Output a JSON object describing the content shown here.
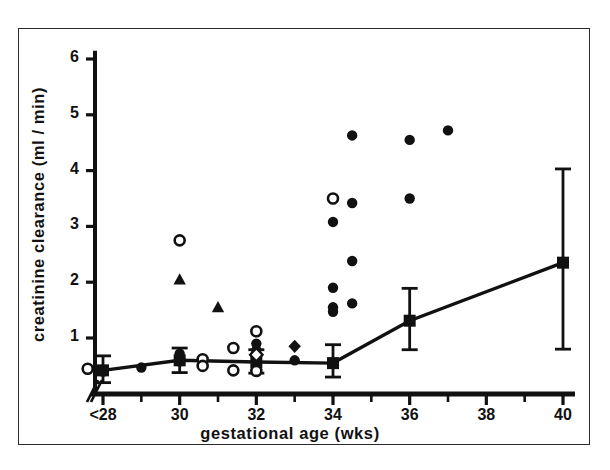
{
  "figure": {
    "name": "creatinine-clearance-vs-gestational-age",
    "background": "#ffffff",
    "ink_color": "#111111"
  },
  "chart_data": {
    "type": "scatter",
    "title": "",
    "xlabel": "gestational age (wks)",
    "ylabel": "creatinine clearance (ml / min)",
    "xlim": [
      27.0,
      41.0
    ],
    "ylim": [
      0,
      6.4
    ],
    "grid": false,
    "legend": "none",
    "x_ticks_major": [
      28,
      30,
      32,
      34,
      36,
      38,
      40
    ],
    "x_tick_labels": [
      "<28",
      "30",
      "32",
      "34",
      "36",
      "38",
      "40"
    ],
    "x_ticks_minor": [
      29,
      31,
      33,
      35,
      37,
      39
    ],
    "y_ticks": [
      1,
      2,
      3,
      4,
      5,
      6
    ],
    "y_tick_labels": [
      "1",
      "2",
      "3",
      "4",
      "5",
      "6"
    ],
    "axis_break": true,
    "axis_break_note": "double slash break on x-axis just left of <28",
    "series": [
      {
        "name": "mean with error bars",
        "marker": "filled-square",
        "line": true,
        "points": [
          {
            "x": 28.0,
            "y": 0.42,
            "err_low": 0.22,
            "err_high": 0.26
          },
          {
            "x": 30.0,
            "y": 0.6,
            "err_low": 0.22,
            "err_high": 0.22
          },
          {
            "x": 32.0,
            "y": 0.57,
            "err_low": 0.2,
            "err_high": 0.22
          },
          {
            "x": 34.0,
            "y": 0.55,
            "err_low": 0.25,
            "err_high": 0.33
          },
          {
            "x": 36.0,
            "y": 1.31,
            "err_low": 0.52,
            "err_high": 0.58
          },
          {
            "x": 40.0,
            "y": 2.35,
            "err_low": 1.55,
            "err_high": 1.68
          }
        ]
      },
      {
        "name": "individual filled circles",
        "marker": "filled-circle",
        "line": false,
        "points": [
          {
            "x": 28.0,
            "y": 0.4
          },
          {
            "x": 29.0,
            "y": 0.47
          },
          {
            "x": 30.0,
            "y": 0.72
          },
          {
            "x": 30.0,
            "y": 0.58
          },
          {
            "x": 32.0,
            "y": 0.9
          },
          {
            "x": 32.0,
            "y": 0.78
          },
          {
            "x": 32.0,
            "y": 0.62
          },
          {
            "x": 33.0,
            "y": 0.6
          },
          {
            "x": 34.0,
            "y": 3.08
          },
          {
            "x": 34.0,
            "y": 1.9
          },
          {
            "x": 34.0,
            "y": 1.55
          },
          {
            "x": 34.0,
            "y": 1.47
          },
          {
            "x": 34.5,
            "y": 4.63
          },
          {
            "x": 34.5,
            "y": 3.42
          },
          {
            "x": 34.5,
            "y": 2.38
          },
          {
            "x": 34.5,
            "y": 1.62
          },
          {
            "x": 36.0,
            "y": 4.55
          },
          {
            "x": 36.0,
            "y": 3.5
          },
          {
            "x": 37.0,
            "y": 4.72
          }
        ]
      },
      {
        "name": "individual open circles",
        "marker": "open-circle",
        "line": false,
        "points": [
          {
            "x": 27.6,
            "y": 0.45
          },
          {
            "x": 30.0,
            "y": 2.75
          },
          {
            "x": 30.6,
            "y": 0.62
          },
          {
            "x": 30.6,
            "y": 0.5
          },
          {
            "x": 31.4,
            "y": 0.82
          },
          {
            "x": 31.4,
            "y": 0.42
          },
          {
            "x": 32.0,
            "y": 1.12
          },
          {
            "x": 32.0,
            "y": 0.41
          },
          {
            "x": 34.0,
            "y": 3.5
          }
        ]
      },
      {
        "name": "individual filled triangles",
        "marker": "filled-triangle",
        "line": false,
        "points": [
          {
            "x": 30.0,
            "y": 2.05
          },
          {
            "x": 31.0,
            "y": 1.55
          }
        ]
      },
      {
        "name": "individual filled diamonds",
        "marker": "filled-diamond",
        "line": false,
        "points": [
          {
            "x": 33.0,
            "y": 0.85
          }
        ]
      },
      {
        "name": "individual open diamonds",
        "marker": "open-diamond",
        "line": false,
        "points": [
          {
            "x": 32.0,
            "y": 0.7
          }
        ]
      }
    ]
  }
}
